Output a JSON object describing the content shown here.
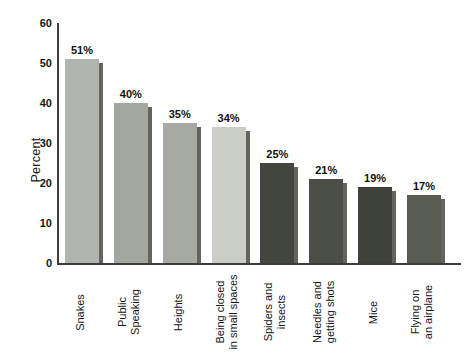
{
  "chart_data": {
    "type": "bar",
    "title": "",
    "xlabel": "",
    "ylabel": "Percent",
    "ylim": [
      0,
      60
    ],
    "yticks": [
      0,
      10,
      20,
      30,
      40,
      50,
      60
    ],
    "grid": "off",
    "legend": "none",
    "categories": [
      [
        "Snakes"
      ],
      [
        "Public",
        "Speaking"
      ],
      [
        "Heights"
      ],
      [
        "Being closed",
        "in small spaces"
      ],
      [
        "Spiders and",
        "insects"
      ],
      [
        "Needles and",
        "getting shots"
      ],
      [
        "Mice"
      ],
      [
        "Flying on",
        "an airplane"
      ]
    ],
    "values": [
      51,
      40,
      35,
      34,
      25,
      21,
      19,
      17
    ],
    "value_labels": [
      "51%",
      "40%",
      "35%",
      "34%",
      "25%",
      "21%",
      "19%",
      "17%"
    ],
    "bar_colors": [
      "#b0b5af",
      "#a2a79f",
      "#a6aaa2",
      "#cbcec7",
      "#43463e",
      "#4c4f47",
      "#3f423a",
      "#585b52"
    ],
    "shadow_color": "#62655d",
    "axis_color": "#3a3d38",
    "text_color": "#161616",
    "background_color": "#ffffff"
  }
}
